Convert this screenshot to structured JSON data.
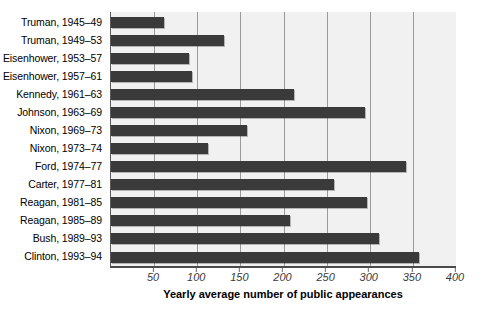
{
  "chart_data": {
    "type": "bar",
    "orientation": "horizontal",
    "title": "",
    "xlabel": "Yearly average number of public appearances",
    "ylabel": "",
    "xlim": [
      0,
      400
    ],
    "xticks": [
      50,
      100,
      150,
      200,
      250,
      300,
      350,
      400
    ],
    "xtick_labels": [
      "50",
      "100",
      "150",
      "200",
      "250",
      "300",
      "350",
      "400"
    ],
    "grid": "vertical",
    "legend": "none",
    "bar_color": "#3a3a3a",
    "plot_background": "#f1f1f1",
    "gridline_color": "#9a9a9a",
    "categories": [
      "Truman, 1945–49",
      "Truman, 1949–53",
      "Eisenhower, 1953–57",
      "Eisenhower, 1957–61",
      "Kennedy, 1961–63",
      "Johnson, 1963–69",
      "Nixon, 1969–73",
      "Nixon, 1973–74",
      "Ford, 1974–77",
      "Carter, 1977–81",
      "Reagan, 1981–85",
      "Reagan, 1985–89",
      "Bush, 1989–93",
      "Clinton, 1993–94"
    ],
    "values": [
      61,
      131,
      91,
      94,
      212,
      294,
      158,
      112,
      342,
      259,
      297,
      208,
      311,
      357
    ]
  }
}
